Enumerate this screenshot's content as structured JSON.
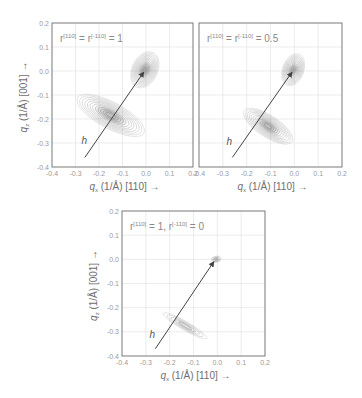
{
  "figure": {
    "panels": [
      {
        "id": "panel-1",
        "frame": {
          "x": 52,
          "y": 23,
          "w": 141,
          "h": 144
        },
        "label": {
          "prefix": "r",
          "sup1": "[110]",
          "mid": " = r",
          "sup2": "[-110]",
          "suffix": " = 1"
        },
        "label_text": "r[110] = r[-110] = 1",
        "show_ylabel": true,
        "ellipses": {
          "top": {
            "cx": -0.005,
            "cy": 0.005,
            "rx": 0.055,
            "ry": 0.08,
            "rot": 25,
            "rings": 14,
            "scale_min": 0.08
          },
          "bottom": {
            "cx": -0.15,
            "cy": -0.185,
            "rx": 0.16,
            "ry": 0.055,
            "rot": 28,
            "rings": 12,
            "scale_min": 0.15
          }
        },
        "arrow": {
          "x1": -0.26,
          "y1": -0.36,
          "x2": -0.01,
          "y2": -0.005
        },
        "h_label_pos": {
          "x": -0.275,
          "y": -0.305
        }
      },
      {
        "id": "panel-2",
        "frame": {
          "x": 199,
          "y": 23,
          "w": 143,
          "h": 144
        },
        "label": {
          "prefix": "r",
          "sup1": "[110]",
          "mid": " = r",
          "sup2": "[-110]",
          "suffix": " = 0.5"
        },
        "label_text": "r[110] = r[-110] = 0.5",
        "show_ylabel": false,
        "ellipses": {
          "top": {
            "cx": -0.005,
            "cy": 0.005,
            "rx": 0.045,
            "ry": 0.07,
            "rot": 20,
            "rings": 13,
            "scale_min": 0.08
          },
          "bottom": {
            "cx": -0.11,
            "cy": -0.23,
            "rx": 0.12,
            "ry": 0.045,
            "rot": 33,
            "rings": 12,
            "scale_min": 0.15
          }
        },
        "arrow": {
          "x1": -0.26,
          "y1": -0.36,
          "x2": -0.01,
          "y2": -0.005
        },
        "h_label_pos": {
          "x": -0.285,
          "y": -0.31
        }
      },
      {
        "id": "panel-3",
        "frame": {
          "x": 122,
          "y": 211,
          "w": 143,
          "h": 145
        },
        "label": {
          "prefix": "r",
          "sup1": "[110]",
          "mid": " = 1, r",
          "sup2": "[-110]",
          "suffix": " = 0"
        },
        "label_text": "r[110] = 1, r[-110] = 0",
        "show_ylabel": true,
        "ellipses": {
          "top": {
            "cx": -0.005,
            "cy": 0.0,
            "rx": 0.02,
            "ry": 0.013,
            "rot": -10,
            "rings": 6,
            "scale_min": 0.2
          },
          "bottom": {
            "cx": -0.135,
            "cy": -0.275,
            "rx": 0.105,
            "ry": 0.018,
            "rot": 30,
            "rings": 5,
            "scale_min": 0.3
          }
        },
        "arrow": {
          "x1": -0.26,
          "y1": -0.37,
          "x2": -0.015,
          "y2": -0.01
        },
        "h_label_pos": {
          "x": -0.285,
          "y": -0.325
        }
      }
    ],
    "axes": {
      "xlim": [
        -0.4,
        0.2
      ],
      "ylim": [
        -0.4,
        0.2
      ],
      "xticks": [
        "-0.4",
        "-0.3",
        "-0.2",
        "-0.1",
        "0.0",
        "0.1",
        "0.2"
      ],
      "yticks": [
        "0.2",
        "0.1",
        "0.0",
        "-0.1",
        "-0.2",
        "-0.3",
        "-0.4"
      ],
      "xlabel": "qx (1/Å)  [110] →",
      "xlabel_parts": {
        "q": "q",
        "sub": "x",
        "rest": " (1/Å)   [110] →"
      },
      "ylabel": "qz (1/Å) [001] →",
      "ylabel_parts": {
        "q": "q",
        "sub": "z",
        "rest": " (1/Å)  [001] →"
      }
    },
    "vector_label": "h",
    "colors": {
      "frame": "#6b6b6b",
      "grid": "#e4e4e4",
      "contour": "#7d7d7d",
      "contour_fill_dark": "#3a3a3a",
      "arrow": "#444444",
      "tick_text": "#9a9a9a"
    }
  },
  "chart_data": [
    {
      "type": "heatmap",
      "title": "r[110] = r[-110] = 1",
      "xlabel": "qx (1/Å) [110]",
      "ylabel": "qz (1/Å) [001]",
      "xlim": [
        -0.4,
        0.2
      ],
      "ylim": [
        -0.4,
        0.2
      ],
      "grid": true,
      "features": [
        {
          "name": "origin peak",
          "center": [
            0.0,
            0.0
          ],
          "shape": "ellipse, tilted"
        },
        {
          "name": "diffuse ellipse",
          "center": [
            -0.15,
            -0.19
          ],
          "shape": "elongated ellipse along ~-30° from x-axis"
        },
        {
          "name": "h vector",
          "from": [
            -0.26,
            -0.36
          ],
          "to": [
            0.0,
            0.0
          ]
        }
      ]
    },
    {
      "type": "heatmap",
      "title": "r[110] = r[-110] = 0.5",
      "xlabel": "qx (1/Å) [110]",
      "ylabel": "qz (1/Å) [001]",
      "xlim": [
        -0.4,
        0.2
      ],
      "ylim": [
        -0.4,
        0.2
      ],
      "grid": true,
      "features": [
        {
          "name": "origin peak",
          "center": [
            0.0,
            0.0
          ],
          "shape": "ellipse, tilted"
        },
        {
          "name": "diffuse ellipse",
          "center": [
            -0.11,
            -0.23
          ],
          "shape": "elongated ellipse"
        },
        {
          "name": "h vector",
          "from": [
            -0.26,
            -0.36
          ],
          "to": [
            0.0,
            0.0
          ]
        }
      ]
    },
    {
      "type": "heatmap",
      "title": "r[110] = 1, r[-110] = 0",
      "xlabel": "qx (1/Å) [110]",
      "ylabel": "qz (1/Å) [001]",
      "xlim": [
        -0.4,
        0.2
      ],
      "ylim": [
        -0.4,
        0.2
      ],
      "grid": true,
      "features": [
        {
          "name": "origin peak",
          "center": [
            0.0,
            0.0
          ],
          "shape": "small spot"
        },
        {
          "name": "diffuse streak",
          "center": [
            -0.135,
            -0.275
          ],
          "shape": "thin elongated ellipse"
        },
        {
          "name": "h vector",
          "from": [
            -0.26,
            -0.37
          ],
          "to": [
            0.0,
            0.0
          ]
        }
      ]
    }
  ]
}
